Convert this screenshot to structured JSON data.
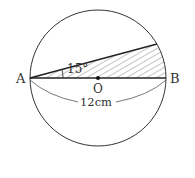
{
  "diagram": {
    "type": "geometry-circle",
    "labels": {
      "point_a": "A",
      "point_b": "B",
      "center": "O",
      "angle": "15°",
      "diameter_length": "12cm"
    },
    "colors": {
      "stroke": "#333333",
      "hatch": "#555555"
    }
  }
}
